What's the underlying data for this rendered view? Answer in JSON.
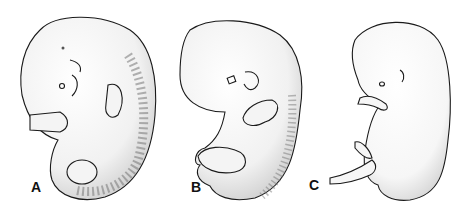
{
  "figure": {
    "panels": [
      {
        "label": "A",
        "subject": "embryo-early-stage"
      },
      {
        "label": "B",
        "subject": "embryo-mid-stage"
      },
      {
        "label": "C",
        "subject": "embryo-late-stage"
      }
    ],
    "colors": {
      "background": "#ffffff",
      "ink": "#1a1a1a",
      "stipple": "#9a9a9a"
    }
  }
}
